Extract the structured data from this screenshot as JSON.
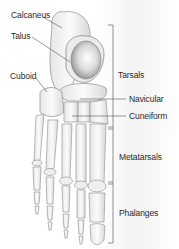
{
  "diagram": {
    "left_labels": [
      {
        "text": "Calcaneus",
        "x": 11,
        "y": 11
      },
      {
        "text": "Talus",
        "x": 11,
        "y": 32
      },
      {
        "text": "Cuboid",
        "x": 10,
        "y": 72
      }
    ],
    "right_labels": [
      {
        "text": "Navicular",
        "x": 129,
        "y": 95
      },
      {
        "text": "Cuneiform",
        "x": 129,
        "y": 112
      }
    ],
    "groups": [
      {
        "text": "Tarsals",
        "x": 118,
        "y": 71,
        "range_y": [
          25,
          128
        ]
      },
      {
        "text": "Metatarsals",
        "x": 119,
        "y": 153,
        "range_y": [
          128,
          183
        ]
      },
      {
        "text": "Phalanges",
        "x": 119,
        "y": 209,
        "range_y": [
          183,
          243
        ]
      }
    ],
    "colors": {
      "label_text": "#2a2a2a",
      "leader_line": "#555555",
      "bone_fill": "#f4f4f4",
      "bone_stroke": "#9a9a9a",
      "bone_shadow": "#c8c8c8"
    }
  }
}
